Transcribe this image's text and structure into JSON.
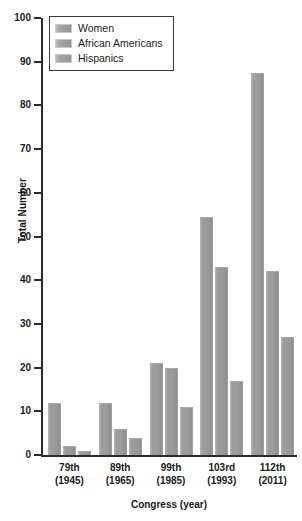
{
  "chart_data": {
    "type": "bar",
    "title": "",
    "xlabel": "Congress (year)",
    "ylabel": "Total Number",
    "categories": [
      "79th\n(1945)",
      "89th\n(1965)",
      "99th\n(1985)",
      "103rd\n(1993)",
      "112th\n(2011)"
    ],
    "category_lines": [
      {
        "congress": "79th",
        "year": "(1945)"
      },
      {
        "congress": "89th",
        "year": "(1965)"
      },
      {
        "congress": "99th",
        "year": "(1985)"
      },
      {
        "congress": "103rd",
        "year": "(1993)"
      },
      {
        "congress": "112th",
        "year": "(2011)"
      }
    ],
    "series": [
      {
        "name": "Women",
        "values": [
          12,
          12,
          21,
          54.5,
          87.5
        ]
      },
      {
        "name": "African Americans",
        "values": [
          2,
          6,
          20,
          43,
          42
        ]
      },
      {
        "name": "Hispanics",
        "values": [
          1,
          4,
          11,
          17,
          27
        ]
      }
    ],
    "ylim": [
      0,
      100
    ],
    "yticks": [
      0,
      10,
      20,
      30,
      40,
      50,
      60,
      70,
      80,
      90,
      100
    ],
    "ytick_labels": [
      "0",
      "10",
      "20",
      "30",
      "40",
      "50",
      "60",
      "70",
      "80",
      "90",
      "100"
    ],
    "grid": false,
    "legend_position": "top-left",
    "colors": {
      "bar_fill": "#9a9a9a",
      "bar_highlight": "#bdbdbd",
      "axis": "#2b2b2b",
      "text": "#1a1a1a",
      "background": "#ffffff"
    }
  },
  "legend": {
    "items": [
      {
        "label": "Women",
        "swatch": "legend-swatch-women"
      },
      {
        "label": "African Americans",
        "swatch": "legend-swatch-african-americans"
      },
      {
        "label": "Hispanics",
        "swatch": "legend-swatch-hispanics"
      }
    ]
  }
}
